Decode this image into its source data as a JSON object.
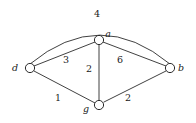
{
  "figure": {
    "kind": "weighted-undirected-graph",
    "background_color": "#ffffff",
    "stroke_color": "#2b2b2b",
    "text_color": "#1a1a1a"
  },
  "nodes": [
    {
      "id": "d",
      "label": "d",
      "cx": 30,
      "cy": 68,
      "r": 4.6,
      "label_x": 15,
      "label_y": 71
    },
    {
      "id": "a",
      "label": "a",
      "cx": 99,
      "cy": 40,
      "r": 4.6,
      "label_x": 108,
      "label_y": 37
    },
    {
      "id": "b",
      "label": "b",
      "cx": 170,
      "cy": 68,
      "r": 4.6,
      "label_x": 181,
      "label_y": 71
    },
    {
      "id": "g",
      "label": "g",
      "cx": 99,
      "cy": 105,
      "r": 4.6,
      "label_x": 86,
      "label_y": 112
    }
  ],
  "edges": [
    {
      "id": "d-b",
      "source": "d",
      "target": "b",
      "weight": "4",
      "shape": "arc",
      "path": "M 30 64 Q 100 6 170 64",
      "label_x": 97,
      "label_y": 17
    },
    {
      "id": "d-a",
      "source": "d",
      "target": "a",
      "weight": "3",
      "shape": "line",
      "path": "M 34 66 L 95 42",
      "label_x": 66,
      "label_y": 63
    },
    {
      "id": "a-b",
      "source": "a",
      "target": "b",
      "weight": "6",
      "shape": "line",
      "path": "M 103 42 L 166 66",
      "label_x": 120,
      "label_y": 63
    },
    {
      "id": "a-g",
      "source": "a",
      "target": "g",
      "weight": "2",
      "shape": "line",
      "path": "M 99 45 L 99 100",
      "label_x": 89,
      "label_y": 72
    },
    {
      "id": "d-g",
      "source": "d",
      "target": "g",
      "weight": "1",
      "shape": "line",
      "path": "M 34 71 L 95 103",
      "label_x": 58,
      "label_y": 101
    },
    {
      "id": "g-b",
      "source": "g",
      "target": "b",
      "weight": "2",
      "shape": "line",
      "path": "M 104 102 L 166 71",
      "label_x": 128,
      "label_y": 101
    }
  ]
}
